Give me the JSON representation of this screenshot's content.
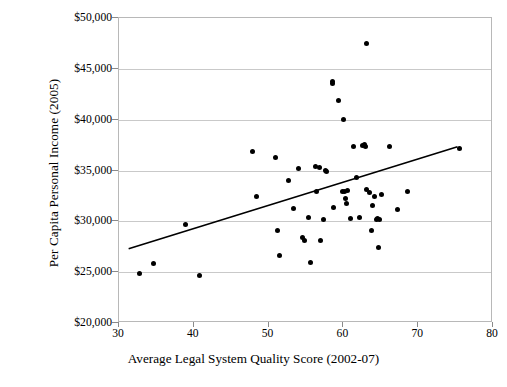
{
  "chart_data": {
    "type": "scatter",
    "title": "",
    "xlabel": "Average Legal System Quality Score (2002-07)",
    "ylabel": "Per Capita Personal Income (2005)",
    "xlim": [
      30,
      80
    ],
    "ylim": [
      20000,
      50000
    ],
    "xticks": [
      30,
      40,
      50,
      60,
      70,
      80
    ],
    "yticks": [
      20000,
      25000,
      30000,
      35000,
      40000,
      45000,
      50000
    ],
    "xtick_labels": [
      "30",
      "40",
      "50",
      "60",
      "70",
      "80"
    ],
    "ytick_labels": [
      "$20,000",
      "$25,000",
      "$30,000",
      "$35,000",
      "$40,000",
      "$45,000",
      "$50,000"
    ],
    "grid": "horizontal",
    "legend": "none",
    "marker_color": "#000000",
    "trendline_color": "#000000",
    "trendline": {
      "x": [
        31.3,
        75.5
      ],
      "y": [
        27150,
        37250
      ],
      "label": "linear fit"
    },
    "points": [
      {
        "x": 32.7,
        "y": 24900
      },
      {
        "x": 34.6,
        "y": 25900
      },
      {
        "x": 38.9,
        "y": 29650
      },
      {
        "x": 40.8,
        "y": 24650
      },
      {
        "x": 47.9,
        "y": 36900
      },
      {
        "x": 48.4,
        "y": 32450
      },
      {
        "x": 50.9,
        "y": 36250
      },
      {
        "x": 51.2,
        "y": 29150
      },
      {
        "x": 51.4,
        "y": 26650
      },
      {
        "x": 52.6,
        "y": 34050
      },
      {
        "x": 53.3,
        "y": 31300
      },
      {
        "x": 54.0,
        "y": 35200
      },
      {
        "x": 54.5,
        "y": 28450
      },
      {
        "x": 54.8,
        "y": 28150
      },
      {
        "x": 55.3,
        "y": 30400
      },
      {
        "x": 55.6,
        "y": 26000
      },
      {
        "x": 56.2,
        "y": 35350
      },
      {
        "x": 56.4,
        "y": 32950
      },
      {
        "x": 56.8,
        "y": 35300
      },
      {
        "x": 56.9,
        "y": 28100
      },
      {
        "x": 57.3,
        "y": 30200
      },
      {
        "x": 57.6,
        "y": 35050
      },
      {
        "x": 57.8,
        "y": 34950
      },
      {
        "x": 58.5,
        "y": 43600
      },
      {
        "x": 58.6,
        "y": 43750
      },
      {
        "x": 58.7,
        "y": 31350
      },
      {
        "x": 59.4,
        "y": 41900
      },
      {
        "x": 59.9,
        "y": 32950
      },
      {
        "x": 60.0,
        "y": 40050
      },
      {
        "x": 60.2,
        "y": 32900
      },
      {
        "x": 60.3,
        "y": 32250
      },
      {
        "x": 60.4,
        "y": 31750
      },
      {
        "x": 60.6,
        "y": 33050
      },
      {
        "x": 60.9,
        "y": 30300
      },
      {
        "x": 61.3,
        "y": 37350
      },
      {
        "x": 61.7,
        "y": 34350
      },
      {
        "x": 62.1,
        "y": 30350
      },
      {
        "x": 62.5,
        "y": 37500
      },
      {
        "x": 62.8,
        "y": 37550
      },
      {
        "x": 62.9,
        "y": 37400
      },
      {
        "x": 63.1,
        "y": 33100
      },
      {
        "x": 63.1,
        "y": 47450
      },
      {
        "x": 63.5,
        "y": 32850
      },
      {
        "x": 63.7,
        "y": 29100
      },
      {
        "x": 63.9,
        "y": 31550
      },
      {
        "x": 64.1,
        "y": 32400
      },
      {
        "x": 64.4,
        "y": 30150
      },
      {
        "x": 64.6,
        "y": 30250
      },
      {
        "x": 64.7,
        "y": 27450
      },
      {
        "x": 64.8,
        "y": 30200
      },
      {
        "x": 65.1,
        "y": 32600
      },
      {
        "x": 66.2,
        "y": 37400
      },
      {
        "x": 67.2,
        "y": 31200
      },
      {
        "x": 68.5,
        "y": 32950
      },
      {
        "x": 75.5,
        "y": 37150
      }
    ]
  }
}
